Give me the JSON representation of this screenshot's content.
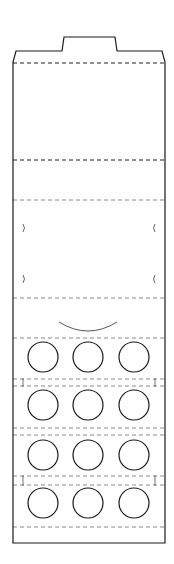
{
  "diagram": {
    "type": "die-cut template",
    "colors": {
      "cut_line": "#1a1a1a",
      "fold_line_dark": "#222222",
      "fold_line_light": "#8a8a8a",
      "background": "#ffffff"
    },
    "outline": {
      "left": 13,
      "right": 165,
      "top_shoulder": 51,
      "bottom": 543,
      "tab": {
        "x1": 62,
        "x2": 117,
        "top": 37
      }
    },
    "fold_lines": [
      {
        "y": 63,
        "style": "dark"
      },
      {
        "y": 160,
        "style": "dark"
      },
      {
        "y": 200,
        "style": "light"
      },
      {
        "y": 298,
        "style": "light"
      },
      {
        "y": 338,
        "style": "light"
      },
      {
        "y": 379,
        "style": "light"
      },
      {
        "y": 386,
        "style": "light"
      },
      {
        "y": 428,
        "style": "light"
      },
      {
        "y": 435,
        "style": "light"
      },
      {
        "y": 476,
        "style": "light"
      },
      {
        "y": 485,
        "style": "light"
      },
      {
        "y": 527,
        "style": "light"
      }
    ],
    "side_notches": [
      {
        "y": 228,
        "side": "left"
      },
      {
        "y": 228,
        "side": "right"
      },
      {
        "y": 279,
        "side": "left"
      },
      {
        "y": 279,
        "side": "right"
      }
    ],
    "tick_marks": [
      {
        "y1": 379,
        "y2": 386
      },
      {
        "y1": 476,
        "y2": 485
      }
    ],
    "arc": {
      "x1": 59,
      "x2": 117,
      "y": 322,
      "depth": 9
    },
    "circles": {
      "columns_x": [
        43,
        88,
        134
      ],
      "rows_y": [
        357,
        405,
        455,
        503
      ],
      "radius": 15
    }
  }
}
